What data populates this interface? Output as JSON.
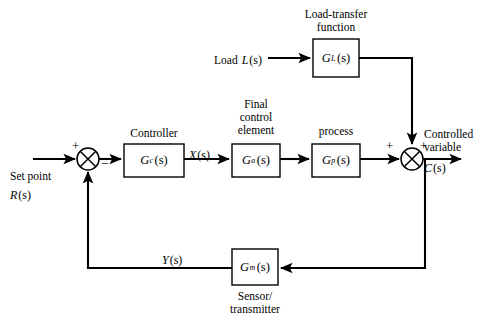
{
  "diagram": {
    "line_color": "#000000",
    "background_color": "#ffffff",
    "blocks": [
      {
        "id": "controller",
        "caption": "Controller",
        "symbol_base": "G",
        "symbol_sub": "c",
        "symbol_arg": "(s)",
        "x": 124,
        "y": 144,
        "width": 60,
        "height": 33
      },
      {
        "id": "final-control-element",
        "caption": "Final control element",
        "caption_lines": [
          "Final",
          "control",
          "element"
        ],
        "symbol_base": "G",
        "symbol_sub": "a",
        "symbol_arg": "(s)",
        "x": 232,
        "y": 144,
        "width": 48,
        "height": 33
      },
      {
        "id": "process",
        "caption": "process",
        "symbol_base": "G",
        "symbol_sub": "p",
        "symbol_arg": "(s)",
        "x": 312,
        "y": 144,
        "width": 48,
        "height": 33
      },
      {
        "id": "load-transfer-function",
        "caption": "Load-transfer function",
        "caption_lines": [
          "Load-transfer",
          "function"
        ],
        "symbol_base": "G",
        "symbol_sub": "L",
        "symbol_arg": "(s)",
        "x": 313,
        "y": 39,
        "width": 46,
        "height": 38
      },
      {
        "id": "sensor-transmitter",
        "caption": "Sensor/ transmitter",
        "caption_lines": [
          "Sensor/",
          "transmitter"
        ],
        "symbol_base": "G",
        "symbol_sub": "m",
        "symbol_arg": "(s)",
        "x": 232,
        "y": 249,
        "width": 46,
        "height": 36
      }
    ],
    "summing_junctions": [
      {
        "id": "error-junction",
        "cx": 88,
        "cy": 159,
        "r": 11,
        "signs": [
          {
            "text": "+",
            "x": 72,
            "y": 140
          },
          {
            "text": "−",
            "x": 101,
            "y": 161
          }
        ]
      },
      {
        "id": "output-junction",
        "cx": 412,
        "cy": 159,
        "r": 11,
        "signs": [
          {
            "text": "+",
            "x": 386,
            "y": 141
          },
          {
            "text": "+",
            "x": 420,
            "y": 141
          }
        ]
      }
    ],
    "signals": [
      {
        "id": "set-point",
        "lines": [
          "Set point",
          "R(s)"
        ],
        "text_plain": "Set point",
        "text_italic": "R",
        "text_arg": "(s)",
        "x": 10,
        "y": 171
      },
      {
        "id": "load-input",
        "text_plain": "Load",
        "text_italic": "L",
        "text_arg": "(s)",
        "x": 215,
        "y": 49
      },
      {
        "id": "controller-output",
        "text_italic": "X",
        "text_arg": "(s)",
        "x": 190,
        "y": 146
      },
      {
        "id": "controlled-variable",
        "lines": [
          "Controlled",
          "variable",
          "C(s)"
        ],
        "text_plain_1": "Controlled",
        "text_plain_2": "variable",
        "text_italic": "C",
        "text_arg": "(s)",
        "x": 424,
        "y": 129
      },
      {
        "id": "feedback-signal",
        "text_italic": "Y",
        "text_arg": "(s)",
        "x": 163,
        "y": 251
      }
    ]
  }
}
